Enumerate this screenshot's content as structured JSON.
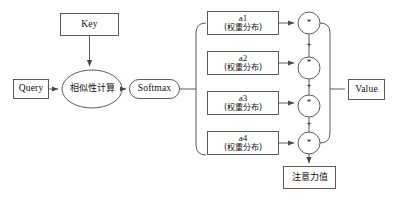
{
  "diagram": {
    "stroke_color": "#4a4a4a",
    "text_color": "#111111",
    "background": "#ffffff",
    "inputs": {
      "query": {
        "label": "Query"
      },
      "key": {
        "label": "Key"
      },
      "value": {
        "label": "Value"
      }
    },
    "similarity": {
      "label": "相似性计算"
    },
    "softmax": {
      "label": "Softmax"
    },
    "weights": [
      {
        "name": "a1",
        "desc": "(权重分布)"
      },
      {
        "name": "a2",
        "desc": "(权重分布)"
      },
      {
        "name": "a3",
        "desc": "(权重分布)"
      },
      {
        "name": "a4",
        "desc": "(权重分布)"
      }
    ],
    "multiply_ops": [
      {
        "symbol": "*"
      },
      {
        "symbol": "*"
      },
      {
        "symbol": "*"
      },
      {
        "symbol": "*"
      }
    ],
    "plus_ops": [
      {
        "symbol": "+"
      },
      {
        "symbol": "+"
      },
      {
        "symbol": "+"
      }
    ],
    "output": {
      "label": "注意力值"
    }
  }
}
